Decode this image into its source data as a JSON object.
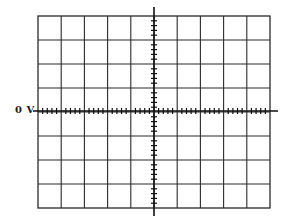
{
  "figure": {
    "type": "oscilloscope-graticule",
    "reference_label": "0 V",
    "grid": {
      "columns": 10,
      "rows": 8,
      "minor_ticks_per_division": 5,
      "left": 38,
      "top": 16,
      "right": 270,
      "bottom": 208
    },
    "axes": {
      "horizontal": {
        "y": 111,
        "x_start": 33,
        "x_end": 278
      },
      "vertical": {
        "x": 154,
        "y_start": 7,
        "y_end": 216
      }
    },
    "colors": {
      "line": "#2a2a2a",
      "axis": "#111111",
      "background": "#ffffff"
    }
  }
}
